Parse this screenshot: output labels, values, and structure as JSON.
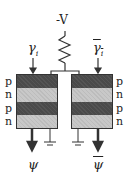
{
  "supply": {
    "label": "-V"
  },
  "inputs": {
    "left": "γ",
    "left_sub": "i",
    "right": "γ̄",
    "right_sub": "i"
  },
  "outputs": {
    "left": "ψ",
    "right": "ψ̄"
  },
  "left_layers": [
    "p",
    "n",
    "p",
    "n"
  ],
  "right_layers": [
    "p",
    "n",
    "p",
    "n"
  ],
  "colors": {
    "p_layer": "#4a4a4a",
    "n_layer": "#c8c8c8",
    "line": "#333333"
  }
}
